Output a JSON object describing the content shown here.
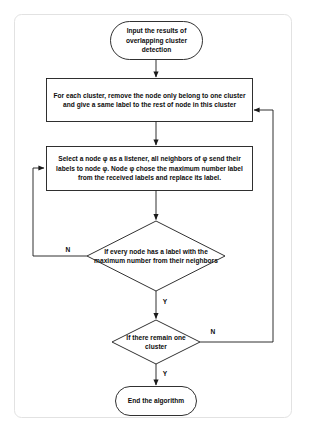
{
  "diagram": {
    "type": "flowchart",
    "colors": {
      "stroke": "#1a1a1a",
      "text": "#0d0d0d",
      "background": "#ffffff",
      "frame": "#e0e0e0"
    },
    "nodes": [
      {
        "id": "start",
        "shape": "terminator",
        "text": "Input the results of overlapping cluster detection"
      },
      {
        "id": "process-1",
        "shape": "process",
        "text": "For each cluster, remove the node only belong to one cluster and give a same label to the rest of node in this cluster"
      },
      {
        "id": "process-2",
        "shape": "process",
        "text": "Select a node  φ as a listener,  all neighbors of  φ send their labels to node  φ. Node  φ chose the maximum number label from the received labels and replace its label."
      },
      {
        "id": "decision-1",
        "shape": "decision",
        "text": "If every node has a label with the maximum number from their neighbors"
      },
      {
        "id": "decision-2",
        "shape": "decision",
        "text": "If there remain one cluster"
      },
      {
        "id": "end",
        "shape": "terminator",
        "text": "End the algorithm"
      }
    ],
    "edge_labels": {
      "decision1_no": "N",
      "decision1_yes": "Y",
      "decision2_no": "N",
      "decision2_yes": "Y"
    }
  }
}
